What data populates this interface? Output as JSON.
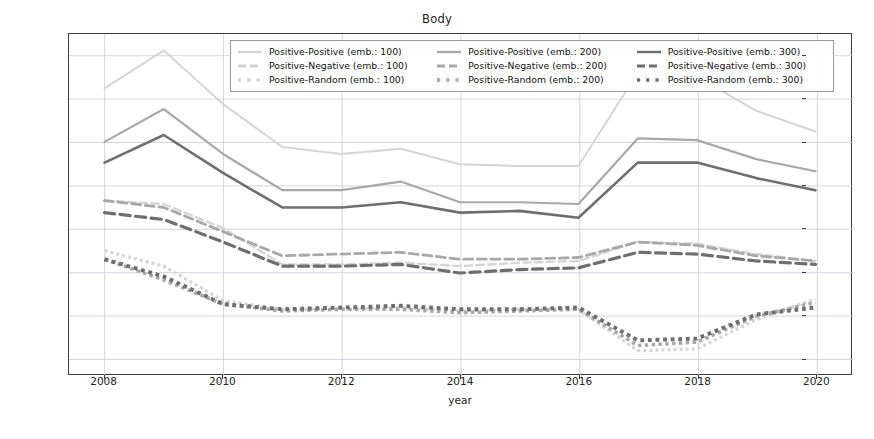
{
  "figure": {
    "title": "Body",
    "xaxis_title": "year",
    "ytick_labels": [
      "0.150",
      "0.125",
      "0.100",
      "0.075",
      "0.050",
      "0.025",
      "0.000",
      "-0.025"
    ],
    "xtick_labels": [
      "2008",
      "2010",
      "2012",
      "2014",
      "2016",
      "2018",
      "2020"
    ]
  },
  "legend": {
    "entries": [
      {
        "label": "Positive-Positive (emb.: 100)",
        "style": "solid",
        "color": "#d5d5d5"
      },
      {
        "label": "Positive-Negative (emb.: 100)",
        "style": "dashed",
        "color": "#d5d5d5"
      },
      {
        "label": "Positive-Random (emb.: 100)",
        "style": "dotted",
        "color": "#d5d5d5"
      },
      {
        "label": "Positive-Positive (emb.: 200)",
        "style": "solid",
        "color": "#a8a8a8"
      },
      {
        "label": "Positive-Negative (emb.: 200)",
        "style": "dashed",
        "color": "#a8a8a8"
      },
      {
        "label": "Positive-Random (emb.: 200)",
        "style": "dotted",
        "color": "#a8a8a8"
      },
      {
        "label": "Positive-Positive (emb.: 300)",
        "style": "solid",
        "color": "#6e6e6e"
      },
      {
        "label": "Positive-Negative (emb.: 300)",
        "style": "dashed",
        "color": "#6e6e6e"
      },
      {
        "label": "Positive-Random (emb.: 300)",
        "style": "dotted",
        "color": "#6e6e6e"
      }
    ]
  },
  "chart_data": {
    "type": "line",
    "title": "Body",
    "xlabel": "year",
    "ylabel": "",
    "grid": true,
    "legend_position": "upper center",
    "xlim": [
      2007.4,
      2020.6
    ],
    "ylim": [
      -0.0345,
      0.1625
    ],
    "x": [
      2008,
      2009,
      2010,
      2011,
      2012,
      2013,
      2014,
      2015,
      2016,
      2017,
      2018,
      2019,
      2020
    ],
    "xticks": [
      2008,
      2010,
      2012,
      2014,
      2016,
      2018,
      2020
    ],
    "yticks": [
      -0.025,
      0.0,
      0.025,
      0.05,
      0.075,
      0.1,
      0.125,
      0.15
    ],
    "series": [
      {
        "name": "Positive-Positive (emb.: 100)",
        "style": "solid",
        "color": "#d5d5d5",
        "width": 2.0,
        "values": [
          0.131,
          0.153,
          0.122,
          0.097,
          0.093,
          0.096,
          0.087,
          0.086,
          0.086,
          0.14,
          0.138,
          0.118,
          0.106
        ]
      },
      {
        "name": "Positive-Negative (emb.: 100)",
        "style": "dashed",
        "color": "#d5d5d5",
        "width": 2.4,
        "values": [
          0.066,
          0.064,
          0.05,
          0.029,
          0.029,
          0.03,
          0.028,
          0.03,
          0.031,
          0.042,
          0.041,
          0.035,
          0.031
        ]
      },
      {
        "name": "Positive-Random (emb.: 100)",
        "style": "dotted",
        "color": "#d5d5d5",
        "width": 3.2,
        "values": [
          0.037,
          0.028,
          0.008,
          0.003,
          0.003,
          0.004,
          0.002,
          0.003,
          0.003,
          -0.021,
          -0.02,
          -0.003,
          0.009
        ]
      },
      {
        "name": "Positive-Positive (emb.: 200)",
        "style": "solid",
        "color": "#a8a8a8",
        "width": 2.2,
        "values": [
          0.1,
          0.119,
          0.093,
          0.072,
          0.072,
          0.077,
          0.065,
          0.065,
          0.064,
          0.102,
          0.101,
          0.09,
          0.083
        ]
      },
      {
        "name": "Positive-Negative (emb.: 200)",
        "style": "dashed",
        "color": "#a8a8a8",
        "width": 2.8,
        "values": [
          0.066,
          0.062,
          0.048,
          0.034,
          0.035,
          0.036,
          0.032,
          0.032,
          0.033,
          0.042,
          0.04,
          0.034,
          0.031
        ]
      },
      {
        "name": "Positive-Random (emb.: 200)",
        "style": "dotted",
        "color": "#a8a8a8",
        "width": 3.6,
        "values": [
          0.032,
          0.02,
          0.006,
          0.002,
          0.003,
          0.003,
          0.001,
          0.002,
          0.003,
          -0.018,
          -0.016,
          -0.001,
          0.007
        ]
      },
      {
        "name": "Positive-Positive (emb.: 300)",
        "style": "solid",
        "color": "#6e6e6e",
        "width": 2.6,
        "values": [
          0.088,
          0.104,
          0.082,
          0.062,
          0.062,
          0.065,
          0.059,
          0.06,
          0.056,
          0.088,
          0.088,
          0.079,
          0.072
        ]
      },
      {
        "name": "Positive-Negative (emb.: 300)",
        "style": "dashed",
        "color": "#6e6e6e",
        "width": 3.2,
        "values": [
          0.059,
          0.055,
          0.042,
          0.028,
          0.028,
          0.029,
          0.024,
          0.026,
          0.027,
          0.036,
          0.035,
          0.031,
          0.029
        ]
      },
      {
        "name": "Positive-Random (emb.: 300)",
        "style": "dotted",
        "color": "#6e6e6e",
        "width": 4.0,
        "values": [
          0.032,
          0.022,
          0.006,
          0.003,
          0.004,
          0.005,
          0.003,
          0.003,
          0.004,
          -0.015,
          -0.014,
          0.0,
          0.004
        ]
      }
    ]
  }
}
